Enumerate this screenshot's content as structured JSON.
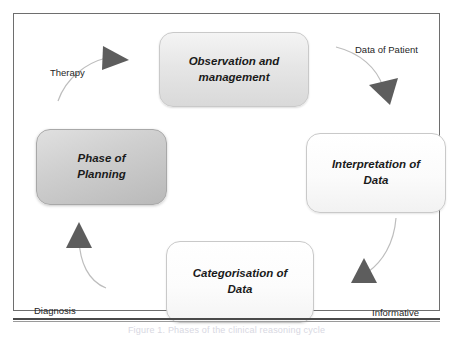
{
  "figure": {
    "caption": "Figure 1. Phases of the clinical reasoning cycle",
    "frame_color": "#6e6e6e",
    "background": "#ffffff"
  },
  "diagram": {
    "type": "cycle",
    "title": "",
    "nodes": [
      {
        "id": "observation",
        "lines": [
          "Observation and",
          "management"
        ],
        "fill": "#e3e3e3",
        "position": "top"
      },
      {
        "id": "interpretation",
        "lines": [
          "Interpretation of",
          "Data"
        ],
        "fill": "#fbfbfb",
        "position": "right"
      },
      {
        "id": "categorisation",
        "lines": [
          "Categorisation of",
          "Data"
        ],
        "fill": "#fcfcfc",
        "position": "bottom"
      },
      {
        "id": "planning",
        "lines": [
          "Phase of",
          "Planning"
        ],
        "fill": "#cdcdcd",
        "position": "left"
      }
    ],
    "edges": [
      {
        "id": "therapy",
        "label": "Therapy",
        "from": "planning",
        "to": "observation",
        "direction": "up-right",
        "arrow_color": "#5d5d5d"
      },
      {
        "id": "data-of-patient",
        "label": "Data of Patient",
        "from": "observation",
        "to": "interpretation",
        "direction": "down-right",
        "arrow_color": "#5d5d5d"
      },
      {
        "id": "informative",
        "label": "Informative",
        "from": "interpretation",
        "to": "categorisation",
        "direction": "up",
        "arrow_color": "#5d5d5d"
      },
      {
        "id": "diagnosis",
        "label": "Diagnosis",
        "from": "categorisation",
        "to": "planning",
        "direction": "up",
        "arrow_color": "#5d5d5d"
      }
    ]
  }
}
